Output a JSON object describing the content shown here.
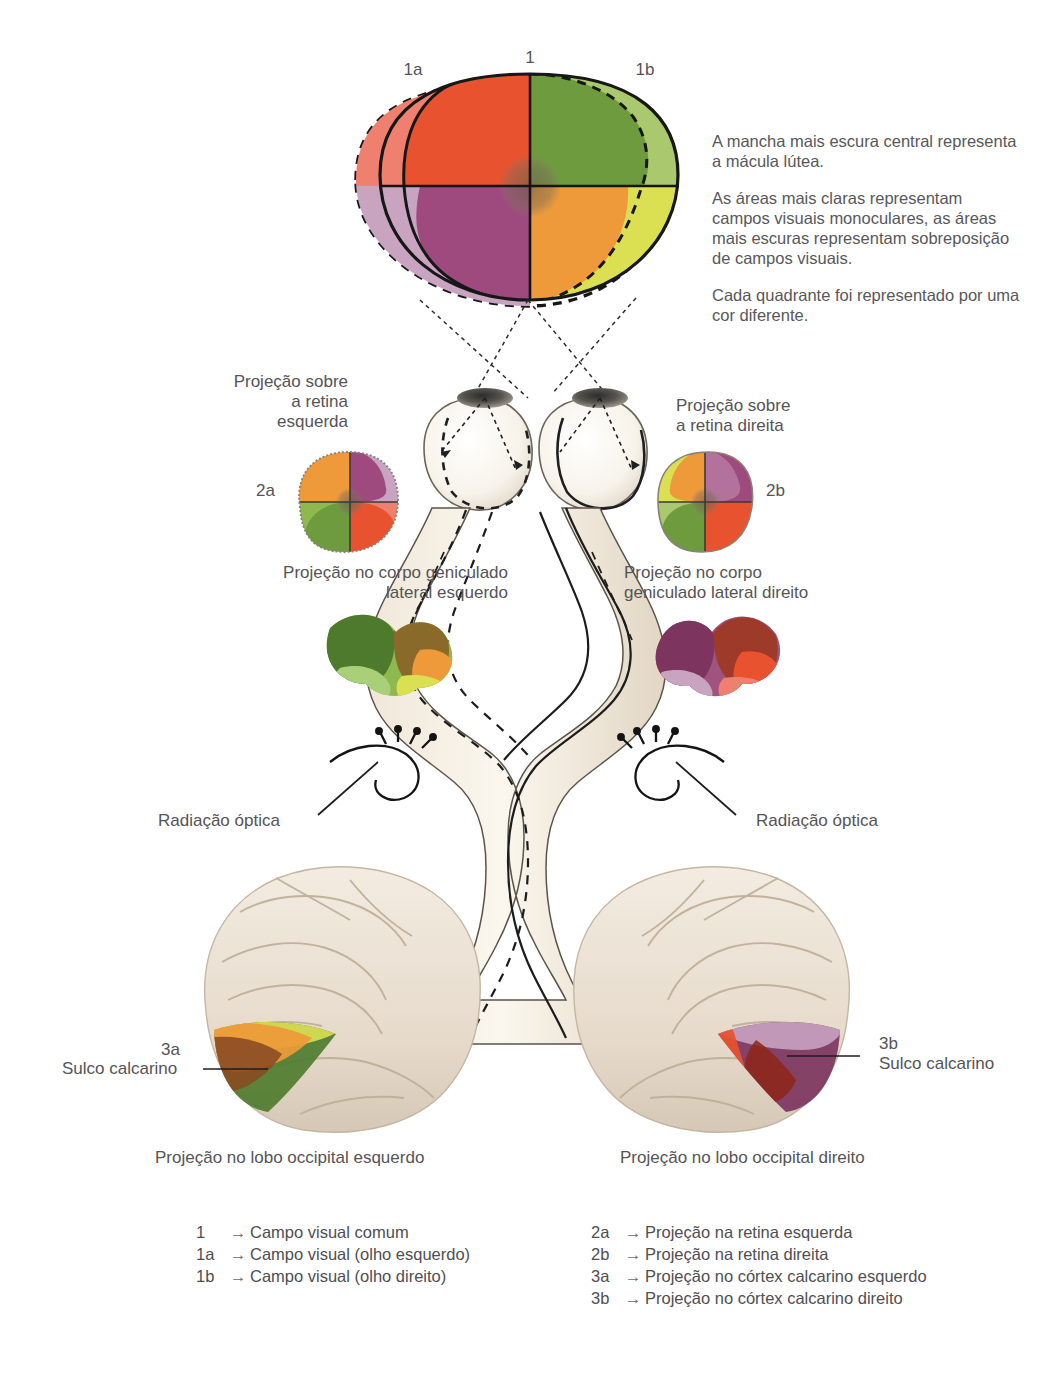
{
  "figure": {
    "language": "pt-BR"
  },
  "field_labels": {
    "common": "1",
    "left_eye": "1a",
    "right_eye": "1b",
    "retina_left": "2a",
    "retina_right": "2b",
    "cortex_left": "3a",
    "cortex_right": "3b"
  },
  "notes": [
    "A mancha mais escura central representa a mácula lútea.",
    "As áreas mais claras representam campos visuais monoculares, as áreas mais escuras representam sobreposição de campos visuais.",
    "Cada quadrante foi representado por uma cor diferente."
  ],
  "callouts": {
    "retina_left": "Projeção sobre\na retina\nesquerda",
    "retina_right": "Projeção sobre\na retina direita",
    "lgn_left": "Projeção no corpo geniculado\nlateral esquerdo",
    "lgn_right": "Projeção no corpo\ngeniculado lateral direito",
    "optic_radiation_left": "Radiação óptica",
    "optic_radiation_right": "Radiação óptica",
    "calcarine_left": "Sulco calcarino",
    "calcarine_right": "Sulco calcarino",
    "occipital_left": "Projeção no lobo occipital esquerdo",
    "occipital_right": "Projeção no lobo occipital direito"
  },
  "legend": {
    "left_column": [
      {
        "key": "1",
        "arrow": "→",
        "text": "Campo visual comum"
      },
      {
        "key": "1a",
        "arrow": "→",
        "text": "Campo visual (olho esquerdo)"
      },
      {
        "key": "1b",
        "arrow": "→",
        "text": "Campo visual (olho direito)"
      }
    ],
    "right_column": [
      {
        "key": "2a",
        "arrow": "→",
        "text": "Projeção na retina esquerda"
      },
      {
        "key": "2b",
        "arrow": "→",
        "text": "Projeção na retina direita"
      },
      {
        "key": "3a",
        "arrow": "→",
        "text": "Projeção no córtex calcarino esquerdo"
      },
      {
        "key": "3b",
        "arrow": "→",
        "text": "Projeção no córtex calcarino direito"
      }
    ]
  },
  "colors": {
    "upper_left_light": "#ef7f6e",
    "upper_left_dark": "#e8522e",
    "upper_right_dark": "#6f9b3f",
    "upper_right_light": "#aac86d",
    "lower_left_light": "#c9a4c1",
    "lower_left_dark": "#9e4a7e",
    "lower_right_dark": "#ee9a3a",
    "lower_right_light": "#dbe053",
    "macula": "#8a7a63",
    "tissue": "#f2ece0",
    "tissue_shade": "#d9cdbc",
    "cortex": "#e9e0d4",
    "outline": "#1a1a1a",
    "text": "#555456"
  }
}
